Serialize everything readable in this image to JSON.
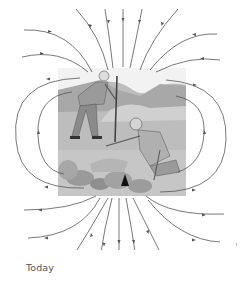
{
  "figure": {
    "scene": {
      "people": 2,
      "objects": [
        "measuring pole",
        "rocks",
        "dark triangular marker in the ground"
      ]
    },
    "field_lines": {
      "top_direction": "inward",
      "bottom_direction": "outward",
      "side_loops_per_side": 2
    },
    "colors": {
      "line": "#555555",
      "photo_bg": "#bdbdbd",
      "sky": "#f2f2f2"
    }
  },
  "caption": {
    "text": "Today"
  }
}
